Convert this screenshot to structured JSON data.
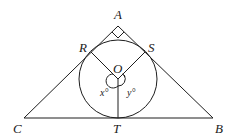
{
  "diagram": {
    "type": "geometry",
    "colors": {
      "stroke": "#1e1e1e",
      "text": "#222222",
      "background": "#ffffff"
    },
    "points": {
      "A": {
        "label": "A",
        "x": 118,
        "y": 26
      },
      "B": {
        "label": "B",
        "x": 213,
        "y": 118
      },
      "C": {
        "label": "C",
        "x": 24,
        "y": 118
      },
      "R": {
        "label": "R",
        "x": 91,
        "y": 53
      },
      "S": {
        "label": "S",
        "x": 145,
        "y": 53
      },
      "T": {
        "label": "T",
        "x": 118,
        "y": 118
      },
      "O": {
        "label": "O",
        "x": 118,
        "y": 79
      }
    },
    "circle": {
      "center": "O",
      "radius": 39
    },
    "angles": {
      "x": {
        "label": "x°",
        "text": "x",
        "degree": "°"
      },
      "y": {
        "label": "y°",
        "text": "y",
        "degree": "°"
      }
    },
    "right_angle_at": "A"
  }
}
